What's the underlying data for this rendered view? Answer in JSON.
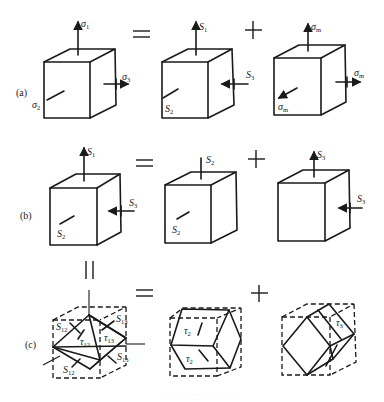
{
  "figure": {
    "rows": [
      {
        "label": "(a)",
        "cubes": [
          {
            "top": "σ",
            "top_sub": "1",
            "right": "σ",
            "right_sub": "3",
            "front": "σ",
            "front_sub": "2"
          },
          {
            "top": "S",
            "top_sub": "1",
            "right": "S",
            "right_sub": "3",
            "front": "S",
            "front_sub": "2"
          },
          {
            "top": "σ",
            "top_sub": "m",
            "right": "σ",
            "right_sub": "m",
            "front": "σ",
            "front_sub": "m"
          }
        ],
        "operators": [
          "=",
          "+"
        ]
      },
      {
        "label": "(b)",
        "cubes": [
          {
            "top": "S",
            "top_sub": "1",
            "right": "S",
            "right_sub": "3",
            "front": "S",
            "front_sub": "2"
          },
          {
            "top": "S",
            "top_sub": "2",
            "front": "S",
            "front_sub": "2"
          },
          {
            "top": "S",
            "top_sub": "3",
            "right": "S",
            "right_sub": "3"
          }
        ],
        "operators": [
          "=",
          "+"
        ]
      },
      {
        "label": "(c)",
        "cubes": [
          {
            "labels": [
              {
                "t": "S",
                "s": "12"
              },
              {
                "t": "S",
                "s": "13"
              },
              {
                "t": "τ",
                "s": "12"
              },
              {
                "t": "τ",
                "s": "13"
              },
              {
                "t": "S",
                "s": "13"
              },
              {
                "t": "S",
                "s": "12"
              }
            ]
          },
          {
            "labels": [
              {
                "t": "τ",
                "s": "2"
              },
              {
                "t": "τ",
                "s": "2"
              }
            ]
          },
          {
            "labels": [
              {
                "t": "τ",
                "s": "3"
              }
            ]
          }
        ],
        "operators": [
          "=",
          "+"
        ]
      }
    ],
    "vertical_equals": "||",
    "caption": "· · · · · · · · · · · · ·"
  }
}
